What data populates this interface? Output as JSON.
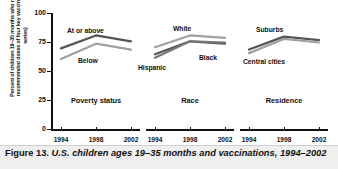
{
  "figure": {
    "caption_label": "Figure 13.",
    "caption_body": "U.S. children ages 19–35 months and vaccinations, 1994–2002"
  },
  "chart_data": {
    "type": "line",
    "title": "U.S. children ages 19–35 months and vaccinations, 1994–2002",
    "ylabel": "Percent of children 19–35 months who received all recommended doses of four key vaccines (4:3:1:3 series)",
    "xlabel": "",
    "ylim": [
      0,
      100
    ],
    "yticks": [
      0,
      25,
      50,
      75,
      100
    ],
    "ytick_labels": [
      "0",
      "25",
      "50",
      "75",
      "100"
    ],
    "x": [
      1994,
      1998,
      2002
    ],
    "xtick_labels": [
      "1994",
      "1998",
      "2002"
    ],
    "grid": false,
    "legend": "inline-labels",
    "panels": [
      {
        "name": "Poverty status",
        "series": [
          {
            "name": "At or above",
            "values": [
              70,
              81,
              76
            ],
            "color": "#555555",
            "label_pos": "above"
          },
          {
            "name": "Below",
            "values": [
              61,
              74,
              69
            ],
            "color": "#a0a0a0",
            "label_pos": "below"
          }
        ]
      },
      {
        "name": "Race",
        "series": [
          {
            "name": "White",
            "values": [
              71,
              81,
              79
            ],
            "color": "#a0a0a0",
            "label_pos": "above"
          },
          {
            "name": "Black",
            "values": [
              65,
              76,
              74
            ],
            "color": "#555555",
            "label_pos": "right"
          },
          {
            "name": "Hispanic",
            "values": [
              62,
              76,
              75
            ],
            "color": "#777777",
            "label_pos": "left"
          }
        ]
      },
      {
        "name": "Residence",
        "series": [
          {
            "name": "Suburbs",
            "values": [
              69,
              80,
              77
            ],
            "color": "#555555",
            "label_pos": "above"
          },
          {
            "name": "Central cities",
            "values": [
              66,
              78,
              75
            ],
            "color": "#a0a0a0",
            "label_pos": "below"
          }
        ]
      }
    ]
  },
  "axis": {
    "ytick_labels": [
      "100",
      "75",
      "50",
      "25",
      "0"
    ]
  },
  "colors": {
    "axis": "#111111",
    "dark_series": "#555555",
    "light_series": "#a0a0a0",
    "caption_bg": "#efefef"
  }
}
